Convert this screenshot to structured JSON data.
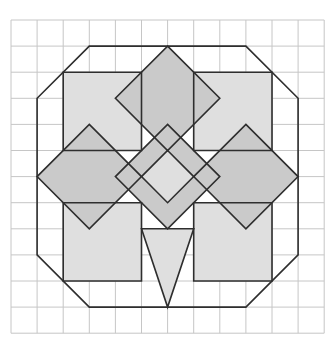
{
  "figure": {
    "canvas": {
      "width": 334,
      "height": 347,
      "background": "#ffffff"
    },
    "grid": {
      "origin_x": 11,
      "origin_y": 20,
      "cell_size": 26.1,
      "cols": 12,
      "rows": 12,
      "line_color": "#c6c6c6",
      "line_width": 1
    },
    "style": {
      "light_fill": "#dfdfdf",
      "dark_fill": "#cacaca",
      "none_fill": "none",
      "stroke_color": "#2e2e2e",
      "stroke_width": 1.6
    },
    "shapes": [
      {
        "name": "square-top-left",
        "fill": "light",
        "points": [
          [
            2,
            2
          ],
          [
            5,
            2
          ],
          [
            5,
            5
          ],
          [
            2,
            5
          ]
        ]
      },
      {
        "name": "square-top-right",
        "fill": "light",
        "points": [
          [
            7,
            2
          ],
          [
            10,
            2
          ],
          [
            10,
            5
          ],
          [
            7,
            5
          ]
        ]
      },
      {
        "name": "square-bottom-left",
        "fill": "light",
        "points": [
          [
            2,
            7
          ],
          [
            5,
            7
          ],
          [
            5,
            10
          ],
          [
            2,
            10
          ]
        ]
      },
      {
        "name": "square-bottom-right",
        "fill": "light",
        "points": [
          [
            7,
            7
          ],
          [
            10,
            7
          ],
          [
            10,
            10
          ],
          [
            7,
            10
          ]
        ]
      },
      {
        "name": "diamond-top",
        "fill": "dark",
        "points": [
          [
            6,
            1
          ],
          [
            8,
            3
          ],
          [
            6,
            5
          ],
          [
            4,
            3
          ]
        ]
      },
      {
        "name": "diamond-left",
        "fill": "dark",
        "points": [
          [
            3,
            4
          ],
          [
            5,
            6
          ],
          [
            3,
            8
          ],
          [
            1,
            6
          ]
        ]
      },
      {
        "name": "diamond-right",
        "fill": "dark",
        "points": [
          [
            9,
            4
          ],
          [
            11,
            6
          ],
          [
            9,
            8
          ],
          [
            7,
            6
          ]
        ]
      },
      {
        "name": "diamond-center",
        "fill": "dark",
        "points": [
          [
            6,
            4
          ],
          [
            8,
            6
          ],
          [
            6,
            8
          ],
          [
            4,
            6
          ]
        ]
      },
      {
        "name": "diamond-center-small",
        "fill": "light",
        "points": [
          [
            6,
            5
          ],
          [
            7,
            6
          ],
          [
            6,
            7
          ],
          [
            5,
            6
          ]
        ]
      },
      {
        "name": "triangle-bottom",
        "fill": "light",
        "points": [
          [
            5,
            8
          ],
          [
            7,
            8
          ],
          [
            6,
            11
          ]
        ]
      },
      {
        "name": "octagon",
        "fill": "none",
        "points": [
          [
            3,
            1
          ],
          [
            9,
            1
          ],
          [
            11,
            3
          ],
          [
            11,
            9
          ],
          [
            9,
            11
          ],
          [
            3,
            11
          ],
          [
            1,
            9
          ],
          [
            1,
            3
          ]
        ]
      }
    ]
  }
}
